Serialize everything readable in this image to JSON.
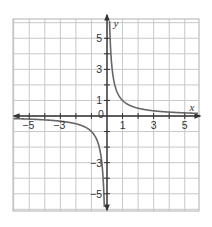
{
  "chart_data": {
    "type": "line",
    "title": "",
    "function": "y = 1/x",
    "xlabel": "x",
    "ylabel": "y",
    "xlim": [
      -6,
      6
    ],
    "ylim": [
      -6,
      6
    ],
    "grid": true,
    "x_tick_labels": [
      "-5",
      "-3",
      "0",
      "1",
      "3",
      "5"
    ],
    "y_tick_labels": [
      "5",
      "3",
      "1",
      "-3",
      "-5"
    ],
    "origin_label": "0",
    "series": [
      {
        "name": "y = 1/x (x > 0)",
        "x": [
          0.17,
          0.2,
          0.25,
          0.33,
          0.5,
          0.75,
          1,
          1.5,
          2,
          3,
          4,
          5,
          5.9
        ],
        "y": [
          5.9,
          5,
          4,
          3,
          2,
          1.33,
          1,
          0.67,
          0.5,
          0.33,
          0.25,
          0.2,
          0.17
        ]
      },
      {
        "name": "y = 1/x (x < 0)",
        "x": [
          -6,
          -5,
          -4,
          -3,
          -2,
          -1.5,
          -1,
          -0.75,
          -0.5,
          -0.33,
          -0.25,
          -0.2,
          -0.17
        ],
        "y": [
          -0.17,
          -0.2,
          -0.25,
          -0.33,
          -0.5,
          -0.67,
          -1,
          -1.33,
          -2,
          -3,
          -4,
          -5,
          -5.9
        ]
      }
    ],
    "colors": {
      "grid": "#c8c8c8",
      "axes": "#333333",
      "curve": "#666666",
      "border": "#bdbdbd"
    }
  }
}
